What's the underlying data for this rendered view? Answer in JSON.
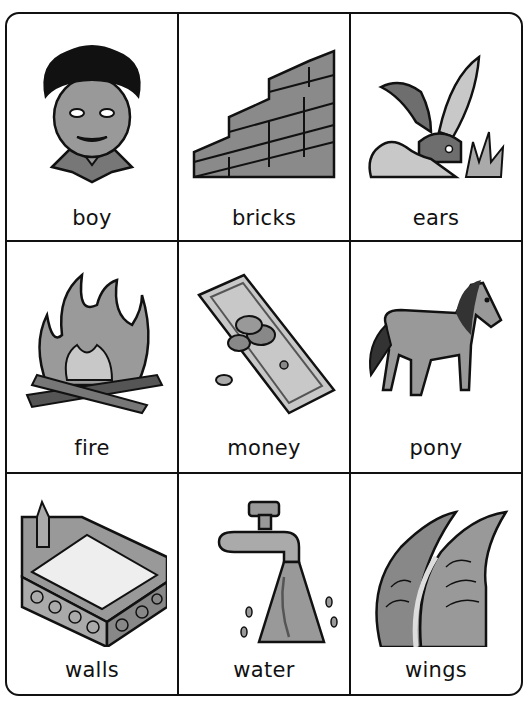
{
  "cards": [
    {
      "word": "boy",
      "icon": "boy-face-icon"
    },
    {
      "word": "bricks",
      "icon": "brick-steps-icon"
    },
    {
      "word": "ears",
      "icon": "rabbit-ears-icon"
    },
    {
      "word": "fire",
      "icon": "campfire-icon"
    },
    {
      "word": "money",
      "icon": "money-bill-coins-icon"
    },
    {
      "word": "pony",
      "icon": "pony-icon"
    },
    {
      "word": "walls",
      "icon": "stone-walls-icon"
    },
    {
      "word": "water",
      "icon": "water-tap-icon"
    },
    {
      "word": "wings",
      "icon": "wings-icon"
    }
  ],
  "colors": {
    "line": "#111111",
    "dark_gray": "#6e6e6e",
    "mid_gray": "#9a9a9a",
    "light_gray": "#c8c8c8",
    "background": "#ffffff"
  }
}
